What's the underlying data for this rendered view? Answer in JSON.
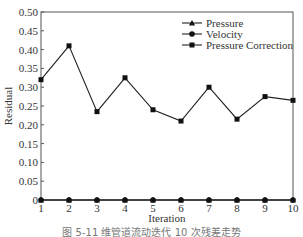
{
  "chart_data": {
    "type": "line",
    "title": "",
    "xlabel": "Iteration",
    "ylabel": "Residual",
    "x": [
      1,
      2,
      3,
      4,
      5,
      6,
      7,
      8,
      9,
      10
    ],
    "xlim": [
      1,
      10
    ],
    "ylim": [
      0,
      0.5
    ],
    "yticks": [
      "0",
      "0.05",
      "0.10",
      "0.15",
      "0.20",
      "0.25",
      "0.30",
      "0.35",
      "0.40",
      "0.45",
      "0.50"
    ],
    "xticks": [
      "1",
      "2",
      "3",
      "4",
      "5",
      "6",
      "7",
      "8",
      "9",
      "10"
    ],
    "grid": false,
    "legend_position": "upper right",
    "series": [
      {
        "name": "Pressure",
        "marker": "triangle",
        "values": [
          0,
          0,
          0,
          0,
          0,
          0,
          0,
          0,
          0,
          0
        ]
      },
      {
        "name": "Velocity",
        "marker": "circle",
        "values": [
          0,
          0,
          0,
          0,
          0,
          0,
          0,
          0,
          0,
          0
        ]
      },
      {
        "name": "Pressure Correction",
        "marker": "square",
        "values": [
          0.32,
          0.41,
          0.235,
          0.325,
          0.24,
          0.21,
          0.3,
          0.215,
          0.275,
          0.265
        ]
      }
    ]
  },
  "caption": "图 5-11    维管道流动迭代 10 次残差走势"
}
